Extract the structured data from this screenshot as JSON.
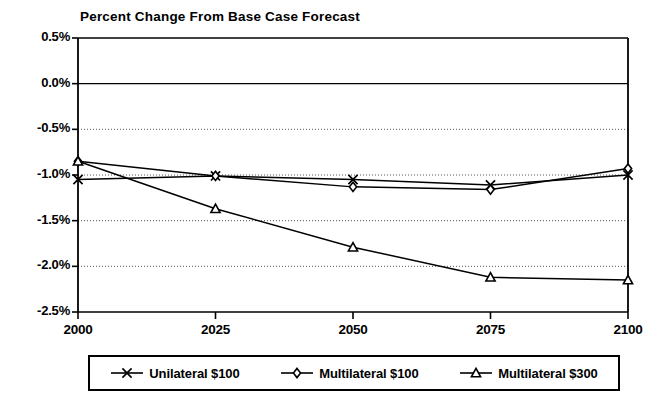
{
  "chart_data": {
    "type": "line",
    "title": "Percent Change From Base Case Forecast",
    "xlabel": "",
    "ylabel": "",
    "x": [
      2000,
      2025,
      2050,
      2075,
      2100
    ],
    "categories": [
      "2000",
      "2025",
      "2050",
      "2075",
      "2100"
    ],
    "xlim": [
      2000,
      2100
    ],
    "ylim": [
      -2.5,
      0.5
    ],
    "ytick_labels": [
      "0.5%",
      "0.0%",
      "-0.5%",
      "-1.0%",
      "-1.5%",
      "-2.0%",
      "-2.5%"
    ],
    "ytick_values": [
      0.5,
      0.0,
      -0.5,
      -1.0,
      -1.5,
      -2.0,
      -2.5
    ],
    "grid": "horizontal-dotted",
    "legend_position": "below-plot",
    "series": [
      {
        "name": "Unilateral $100",
        "marker": "x-cross",
        "values": [
          -1.05,
          -1.01,
          -1.05,
          -1.11,
          -1.0
        ]
      },
      {
        "name": "Multilateral $100",
        "marker": "diamond",
        "values": [
          -0.85,
          -1.01,
          -1.13,
          -1.16,
          -0.93
        ]
      },
      {
        "name": "Multilateral $300",
        "marker": "triangle",
        "values": [
          -0.85,
          -1.37,
          -1.79,
          -2.12,
          -2.15
        ]
      }
    ]
  },
  "legend": {
    "items": [
      {
        "label": "Unilateral $100",
        "marker": "x-cross-marker-icon"
      },
      {
        "label": "Multilateral $100",
        "marker": "diamond-marker-icon"
      },
      {
        "label": "Multilateral $300",
        "marker": "triangle-marker-icon"
      }
    ]
  },
  "colors": {
    "line": "#000000",
    "axis": "#000000",
    "grid": "#555555",
    "background": "#ffffff"
  }
}
